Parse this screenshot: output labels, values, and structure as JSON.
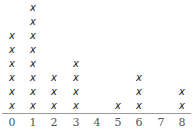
{
  "chart_data": {
    "type": "scatter",
    "subtype": "dot_plot",
    "title": "",
    "xlabel": "",
    "ylabel": "",
    "marker": "X",
    "categories": [
      "0",
      "1",
      "2",
      "3",
      "4",
      "5",
      "6",
      "7",
      "8"
    ],
    "values": [
      6,
      8,
      3,
      4,
      0,
      1,
      3,
      0,
      2
    ],
    "xlim": [
      0,
      8
    ],
    "grid": false,
    "legend": null
  },
  "layout": {
    "x_positions": [
      12,
      33,
      54,
      76,
      97,
      118,
      139,
      161,
      182
    ],
    "baseline_y": 106,
    "spacing": 14
  }
}
